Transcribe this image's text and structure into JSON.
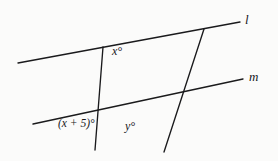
{
  "figure": {
    "background_color": "#fbfbfa",
    "stroke_color": "#1a1a1c",
    "labels": {
      "line_l": "l",
      "line_m": "m",
      "angle_x": "x°",
      "angle_x_plus_5": "(x + 5)°",
      "angle_y": "y°"
    }
  },
  "chart_data": {
    "type": "diagram",
    "lines": [
      {
        "name": "l",
        "role": "parallel-line",
        "label": "l",
        "x1": 18,
        "y1": 63,
        "x2": 240,
        "y2": 22,
        "label_x": 247,
        "label_y": 20
      },
      {
        "name": "m",
        "role": "parallel-line",
        "label": "m",
        "x1": 33,
        "y1": 124,
        "x2": 243,
        "y2": 79,
        "label_x": 251,
        "label_y": 77
      },
      {
        "name": "transversal-left",
        "role": "transversal",
        "label": "",
        "x1": 103,
        "y1": 47,
        "x2": 95,
        "y2": 150,
        "label_x": null,
        "label_y": null
      },
      {
        "name": "transversal-right",
        "role": "transversal",
        "label": "",
        "x1": 204,
        "y1": 29,
        "x2": 164,
        "y2": 152,
        "label_x": null,
        "label_y": null
      }
    ],
    "points": [
      {
        "name": "transversal-left-meets-l",
        "x": 103,
        "y": 47
      },
      {
        "name": "transversal-right-meets-l",
        "x": 204,
        "y": 29
      },
      {
        "name": "transversals-intersection",
        "x": 136,
        "y": 101
      }
    ],
    "angle_labels": [
      {
        "name": "angle-x",
        "text": "x°",
        "x": 118,
        "y": 51,
        "vertex": "transversal-left-meets-l"
      },
      {
        "name": "angle-x-plus-5",
        "text": "(x + 5)°",
        "x": 86,
        "y": 124,
        "vertex": "transversals-intersection"
      },
      {
        "name": "angle-y",
        "text": "y°",
        "x": 131,
        "y": 126,
        "vertex": "transversals-intersection"
      }
    ]
  }
}
